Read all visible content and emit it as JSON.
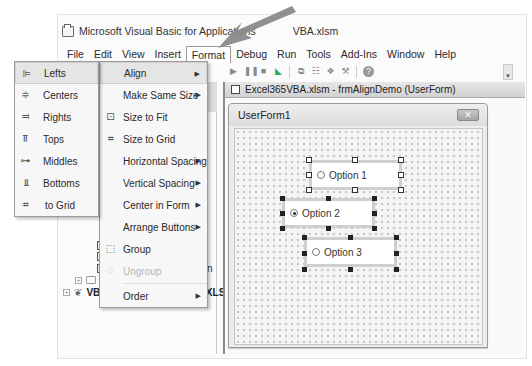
{
  "window": {
    "title_visible_left": "Microsoft Visual Basic for Applications",
    "title_visible_right": "VBA.xlsm"
  },
  "menubar": {
    "items": [
      {
        "label": "File",
        "accel": "F"
      },
      {
        "label": "Edit",
        "accel": "E"
      },
      {
        "label": "View",
        "accel": "V"
      },
      {
        "label": "Insert",
        "accel": "I"
      },
      {
        "label": "Format",
        "accel": "o",
        "active": true
      },
      {
        "label": "Debug",
        "accel": "D"
      },
      {
        "label": "Run",
        "accel": "R"
      },
      {
        "label": "Tools",
        "accel": "T"
      },
      {
        "label": "Add-Ins",
        "accel": "A"
      },
      {
        "label": "Window",
        "accel": "W"
      },
      {
        "label": "Help",
        "accel": "H"
      }
    ]
  },
  "toolbar": {
    "icons": [
      "redo-icon",
      "run-icon",
      "break-icon",
      "reset-icon",
      "design-mode-icon",
      "project-explorer-icon",
      "properties-icon",
      "object-browser-icon",
      "toolbox-icon",
      "help-icon"
    ],
    "overflow_glyph": "▾"
  },
  "format_menu": {
    "items": [
      {
        "label": "Align",
        "submenu": true,
        "highlighted": true,
        "icon": ""
      },
      {
        "label": "Make Same Size",
        "submenu": true,
        "icon": ""
      },
      {
        "label": "Size to Fit",
        "submenu": false,
        "icon": "size-to-fit-icon"
      },
      {
        "label": "Size to Grid",
        "submenu": false,
        "icon": "size-to-grid-icon"
      },
      {
        "label": "Horizontal Spacing",
        "submenu": true,
        "icon": ""
      },
      {
        "label": "Vertical Spacing",
        "submenu": true,
        "icon": ""
      },
      {
        "label": "Center in Form",
        "submenu": true,
        "icon": ""
      },
      {
        "label": "Arrange Buttons",
        "submenu": true,
        "icon": ""
      },
      {
        "label": "Group",
        "submenu": false,
        "icon": "group-icon"
      },
      {
        "label": "Ungroup",
        "submenu": false,
        "disabled": true,
        "icon": "ungroup-icon"
      },
      {
        "label": "Order",
        "submenu": true,
        "icon": ""
      }
    ]
  },
  "align_menu": {
    "items": [
      {
        "label": "Lefts",
        "highlighted": true
      },
      {
        "label": "Centers"
      },
      {
        "label": "Rights"
      },
      {
        "label": "Tops"
      },
      {
        "label": "Middles"
      },
      {
        "label": "Bottoms"
      },
      {
        "label": "to Grid"
      }
    ]
  },
  "project_tree": {
    "items": [
      {
        "label": "frmTextBoxes",
        "partial": true
      },
      {
        "label": "frmUsedCars"
      },
      {
        "label": "frmViewingReservation"
      },
      {
        "label": "Modules"
      },
      {
        "label": "VBAProject (PERSONAL.XLSB)"
      }
    ]
  },
  "designer": {
    "title": "Excel365VBA.xlsm - frmAlignDemo (UserForm)",
    "userform_caption": "UserForm1",
    "close_glyph": "✕",
    "options": [
      {
        "label": "Option 1",
        "checked": false,
        "selection": "primary"
      },
      {
        "label": "Option 2",
        "checked": true,
        "selection": "secondary"
      },
      {
        "label": "Option 3",
        "checked": false,
        "selection": "secondary"
      }
    ]
  },
  "colors": {
    "menu_bg": "#f7f7f7",
    "menu_highlight": "#e5e5e5",
    "grid_bg": "#f4f4f4",
    "arrow_overlay": "#8a8a8a"
  }
}
